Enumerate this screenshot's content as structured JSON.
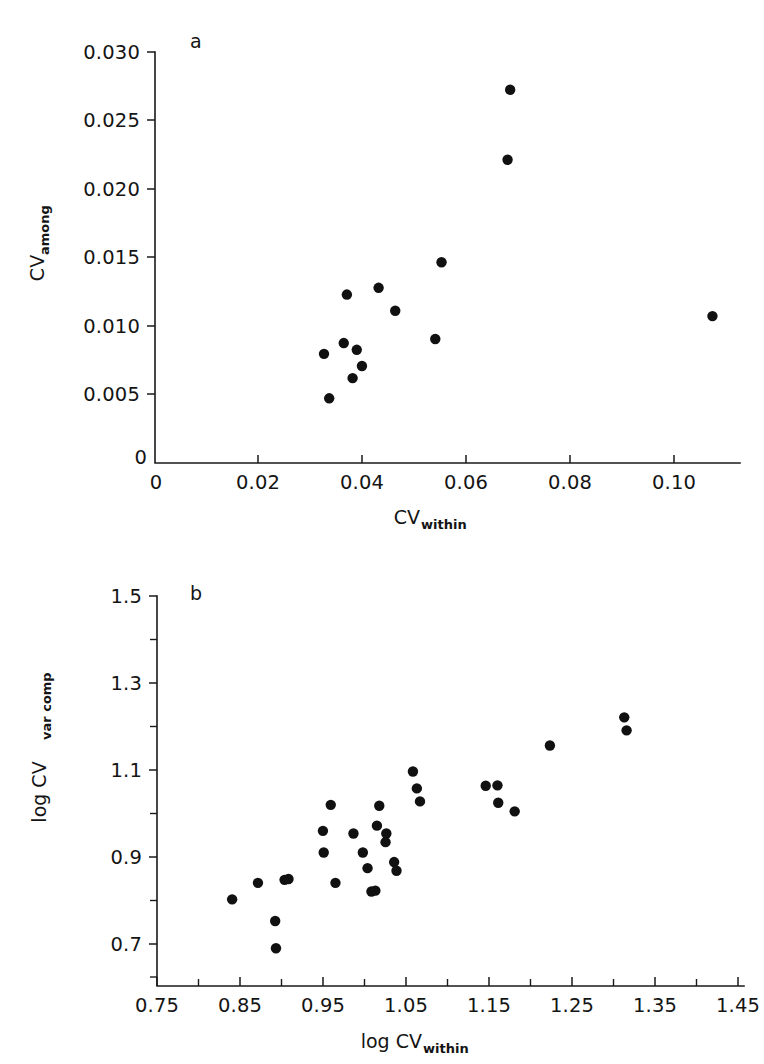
{
  "figure": {
    "background_color": "#ffffff",
    "ink_color": "#111111",
    "panels": [
      "a",
      "b"
    ]
  },
  "panel_a": {
    "letter": "a",
    "letter_pos": {
      "x": 196,
      "y": 46
    },
    "plot_box": {
      "left": 155,
      "right": 740,
      "top": 52,
      "bottom": 463
    },
    "y_axis": {
      "title": "CV",
      "subscript": "among",
      "tick_labels": [
        "0.030",
        "0.025",
        "0.020",
        "0.015",
        "0.010",
        "0.005",
        "0"
      ],
      "tick_values": [
        0.03,
        0.025,
        0.02,
        0.015,
        0.01,
        0.005,
        0
      ],
      "minor_count_between": 0,
      "range": [
        0,
        0.0305
      ]
    },
    "x_axis": {
      "title": "CV",
      "subscript": "within",
      "tick_labels": [
        "0",
        "0.02",
        "0.04",
        "0.06",
        "0.08",
        "0.10"
      ],
      "tick_values": [
        0,
        0.02,
        0.04,
        0.06,
        0.08,
        0.1
      ],
      "range": [
        0,
        0.1125
      ]
    }
  },
  "panel_b": {
    "letter": "b",
    "letter_pos": {
      "x": 196,
      "y": 598
    },
    "plot_box": {
      "left": 157,
      "right": 744,
      "top": 596,
      "bottom": 986
    },
    "y_axis": {
      "title": "log CV",
      "subscript": "var comp",
      "tick_labels": [
        "1.5",
        "1.3",
        "1.1",
        "0.9",
        "0.7"
      ],
      "tick_values": [
        1.5,
        1.3,
        1.1,
        0.9,
        0.7
      ],
      "minor_ticks": [
        1.4,
        1.2,
        1.0,
        0.8,
        0.6
      ],
      "range": [
        0.6,
        1.5
      ]
    },
    "x_axis": {
      "title": "log CV",
      "subscript": "within",
      "tick_labels": [
        "0.75",
        "0.85",
        "0.95",
        "1.05",
        "1.15",
        "1.25",
        "1.35",
        "1.45"
      ],
      "tick_values": [
        0.75,
        0.85,
        0.95,
        1.05,
        1.15,
        1.25,
        1.35,
        1.45
      ],
      "minor_ticks": [
        0.8,
        0.9,
        1.0,
        1.1,
        1.2,
        1.3,
        1.4,
        1.5
      ],
      "range": [
        0.75,
        1.5
      ]
    }
  },
  "chart_data": [
    {
      "type": "scatter",
      "panel": "a",
      "title": "",
      "xlabel": "CV_within",
      "ylabel": "CV_among",
      "xlim": [
        0,
        0.1125
      ],
      "ylim": [
        0,
        0.0305
      ],
      "grid": false,
      "legend": "none",
      "marker": "filled-circle",
      "marker_color": "#111111",
      "marker_radius_px": 5.2,
      "points": [
        {
          "x": 0.0335,
          "y": 0.0048
        },
        {
          "x": 0.0325,
          "y": 0.0081
        },
        {
          "x": 0.0363,
          "y": 0.0089
        },
        {
          "x": 0.0369,
          "y": 0.0125
        },
        {
          "x": 0.038,
          "y": 0.0063
        },
        {
          "x": 0.0388,
          "y": 0.0084
        },
        {
          "x": 0.0398,
          "y": 0.0072
        },
        {
          "x": 0.043,
          "y": 0.013
        },
        {
          "x": 0.0462,
          "y": 0.0113
        },
        {
          "x": 0.0539,
          "y": 0.0092
        },
        {
          "x": 0.0551,
          "y": 0.0149
        },
        {
          "x": 0.0678,
          "y": 0.0225
        },
        {
          "x": 0.0683,
          "y": 0.0277
        },
        {
          "x": 0.1072,
          "y": 0.0109
        }
      ]
    },
    {
      "type": "scatter",
      "panel": "b",
      "title": "",
      "xlabel": "log CV_within",
      "ylabel": "log CV_var comp",
      "xlim": [
        0.75,
        1.5
      ],
      "ylim": [
        0.6,
        1.5
      ],
      "grid": false,
      "legend": "none",
      "marker": "filled-circle",
      "marker_color": "#111111",
      "marker_radius_px": 5.2,
      "points": [
        {
          "x": 0.846,
          "y": 0.8
        },
        {
          "x": 0.879,
          "y": 0.838
        },
        {
          "x": 0.901,
          "y": 0.75
        },
        {
          "x": 0.902,
          "y": 0.687
        },
        {
          "x": 0.913,
          "y": 0.845
        },
        {
          "x": 0.918,
          "y": 0.847
        },
        {
          "x": 0.962,
          "y": 0.958
        },
        {
          "x": 0.963,
          "y": 0.908
        },
        {
          "x": 0.972,
          "y": 1.018
        },
        {
          "x": 0.978,
          "y": 0.838
        },
        {
          "x": 1.001,
          "y": 0.952
        },
        {
          "x": 1.013,
          "y": 0.908
        },
        {
          "x": 1.019,
          "y": 0.872
        },
        {
          "x": 1.024,
          "y": 0.818
        },
        {
          "x": 1.029,
          "y": 0.82
        },
        {
          "x": 1.031,
          "y": 0.97
        },
        {
          "x": 1.034,
          "y": 1.016
        },
        {
          "x": 1.042,
          "y": 0.932
        },
        {
          "x": 1.043,
          "y": 0.952
        },
        {
          "x": 1.053,
          "y": 0.886
        },
        {
          "x": 1.056,
          "y": 0.866
        },
        {
          "x": 1.077,
          "y": 1.095
        },
        {
          "x": 1.082,
          "y": 1.056
        },
        {
          "x": 1.086,
          "y": 1.026
        },
        {
          "x": 1.17,
          "y": 1.062
        },
        {
          "x": 1.185,
          "y": 1.063
        },
        {
          "x": 1.186,
          "y": 1.023
        },
        {
          "x": 1.207,
          "y": 1.003
        },
        {
          "x": 1.252,
          "y": 1.155
        },
        {
          "x": 1.347,
          "y": 1.22
        },
        {
          "x": 1.35,
          "y": 1.19
        }
      ]
    }
  ]
}
